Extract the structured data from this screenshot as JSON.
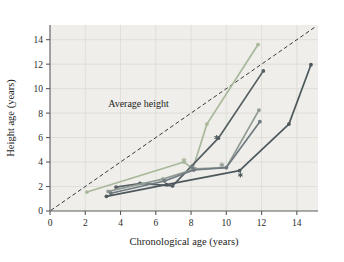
{
  "chart_data": {
    "type": "line",
    "title": "",
    "xlabel": "Chronological age (years)",
    "ylabel": "Height age (years)",
    "xlim": [
      0,
      15.2
    ],
    "ylim": [
      0,
      15.2
    ],
    "xticks": [
      0,
      2,
      4,
      6,
      8,
      10,
      12,
      14
    ],
    "yticks": [
      0,
      2,
      4,
      6,
      8,
      10,
      12,
      14
    ],
    "xtick_labels": [
      "0",
      "2",
      "4",
      "6",
      "8",
      "10",
      "12",
      "14"
    ],
    "ytick_labels": [
      "0",
      "2",
      "4",
      "6",
      "8",
      "10",
      "12",
      "14"
    ],
    "grid": true,
    "legend": "none",
    "plot_bgcolor": "#efeeea",
    "annotations": [
      {
        "name": "average-height-label",
        "text": "Average height",
        "x": 3.3,
        "y": 8.5
      }
    ],
    "reference_line": {
      "name": "average-height-line",
      "style": "dashed",
      "color": "#3a3a3a",
      "x": [
        0.05,
        15.1
      ],
      "y": [
        0.05,
        15.1
      ]
    },
    "series": [
      {
        "name": "patient-1",
        "color": "#a8b89a",
        "marker": "circle",
        "x": [
          2.1,
          7.6,
          8.1,
          8.9,
          11.8
        ],
        "y": [
          1.55,
          4.0,
          3.45,
          7.1,
          13.6
        ],
        "treatment_marker": {
          "x": 7.6,
          "y": 4.15,
          "symbol": "asterisk"
        }
      },
      {
        "name": "patient-2",
        "color": "#555f63",
        "marker": "circle",
        "x": [
          3.75,
          5.1,
          6.95,
          9.55,
          12.1
        ],
        "y": [
          1.95,
          2.25,
          2.05,
          5.95,
          11.45
        ],
        "treatment_marker": {
          "x": 9.45,
          "y": 6.0,
          "symbol": "asterisk"
        }
      },
      {
        "name": "patient-3",
        "color": "#8f9a92",
        "marker": "circle",
        "x": [
          3.3,
          6.4,
          8.25,
          10.0,
          11.85
        ],
        "y": [
          1.6,
          2.6,
          3.45,
          3.55,
          8.25
        ],
        "treatment_marker": {
          "x": 9.75,
          "y": 3.75,
          "symbol": "asterisk"
        }
      },
      {
        "name": "patient-4",
        "color": "#6e7a80",
        "marker": "circle",
        "x": [
          3.45,
          6.5,
          8.15,
          10.0,
          11.9
        ],
        "y": [
          1.45,
          2.45,
          3.35,
          3.55,
          7.3
        ],
        "treatment_marker": {
          "x": 8.05,
          "y": 3.6,
          "symbol": "asterisk"
        }
      },
      {
        "name": "patient-5",
        "color": "#4d585d",
        "marker": "circle",
        "x": [
          3.2,
          6.6,
          10.75,
          13.55,
          14.8
        ],
        "y": [
          1.2,
          2.15,
          3.3,
          7.1,
          11.95
        ],
        "treatment_marker": {
          "x": 10.8,
          "y": 2.95,
          "symbol": "asterisk"
        }
      }
    ]
  }
}
